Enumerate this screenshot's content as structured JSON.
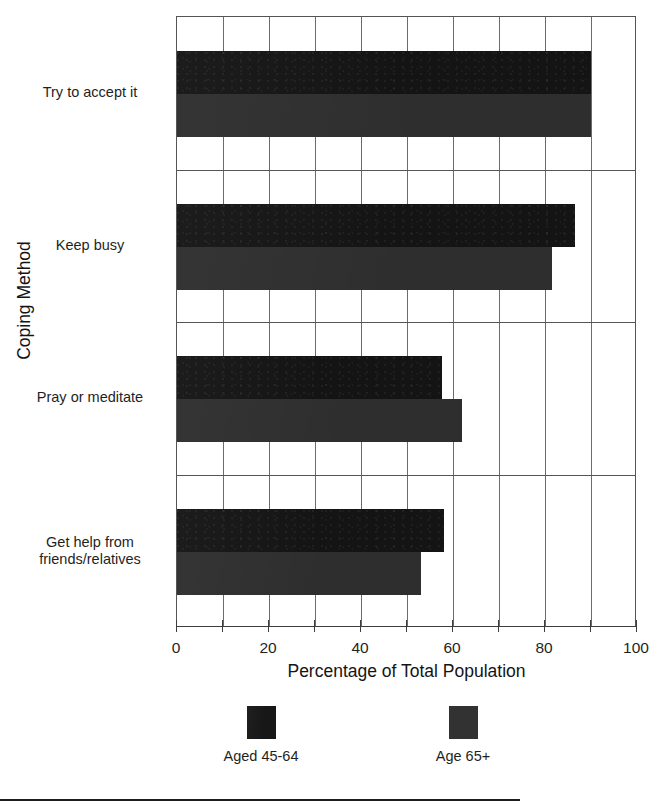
{
  "chart_data": {
    "type": "bar",
    "orientation": "horizontal",
    "title": "",
    "xlabel": "Percentage of Total Population",
    "ylabel": "Coping Method",
    "xlim": [
      0,
      100
    ],
    "xticks": [
      0,
      10,
      20,
      30,
      40,
      50,
      60,
      70,
      80,
      90,
      100
    ],
    "xticklabels": [
      "0",
      "",
      "20",
      "",
      "40",
      "",
      "60",
      "",
      "80",
      "",
      "100"
    ],
    "grid": "vertical",
    "legend_position": "bottom",
    "categories": [
      "Try to accept it",
      "Keep busy",
      "Pray or meditate",
      "Get help from friends/relatives"
    ],
    "series": [
      {
        "name": "Aged 45-64",
        "color": "#141414",
        "values": [
          90,
          86.5,
          57.5,
          58
        ]
      },
      {
        "name": "Age 65+",
        "color": "#2e2e2e",
        "values": [
          90,
          81.5,
          62,
          53
        ]
      }
    ]
  },
  "axis": {
    "x_title": "Percentage of Total Population",
    "y_title": "Coping Method"
  },
  "category_labels": [
    {
      "line1": "Try to accept it",
      "line2": ""
    },
    {
      "line1": "Keep busy",
      "line2": ""
    },
    {
      "line1": "Pray or meditate",
      "line2": ""
    },
    {
      "line1": "Get help from",
      "line2": "friends/relatives"
    }
  ],
  "legend": {
    "entries": [
      {
        "label": "Aged 45-64",
        "color": "#171717"
      },
      {
        "label": "Age 65+",
        "color": "#323232"
      }
    ]
  }
}
